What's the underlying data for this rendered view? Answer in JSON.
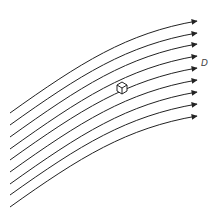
{
  "diagram": {
    "type": "streamlines",
    "line_color": "#222222",
    "line_count": 9,
    "streamlines": [
      {
        "start": [
          10,
          113
        ],
        "end": [
          197,
          21
        ]
      },
      {
        "start": [
          10,
          125
        ],
        "end": [
          197,
          33
        ]
      },
      {
        "start": [
          10,
          137
        ],
        "end": [
          197,
          44
        ]
      },
      {
        "start": [
          10,
          149
        ],
        "end": [
          197,
          56
        ]
      },
      {
        "start": [
          10,
          160
        ],
        "end": [
          197,
          68
        ]
      },
      {
        "start": [
          10,
          172
        ],
        "end": [
          197,
          80
        ]
      },
      {
        "start": [
          10,
          184
        ],
        "end": [
          197,
          92
        ]
      },
      {
        "start": [
          10,
          195
        ],
        "end": [
          197,
          104
        ]
      },
      {
        "start": [
          10,
          207
        ],
        "end": [
          197,
          116
        ]
      }
    ],
    "label": {
      "text": "D",
      "x": 201,
      "y": 58
    },
    "cube_marker": {
      "x": 122,
      "y": 87,
      "name": "fluid-element-cube"
    }
  }
}
